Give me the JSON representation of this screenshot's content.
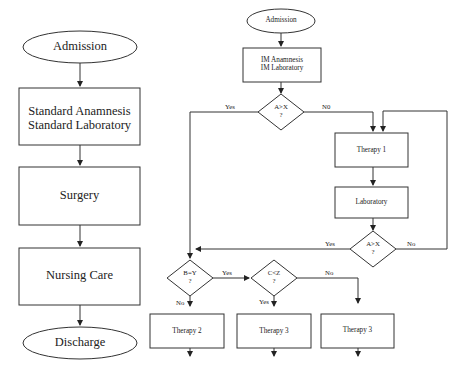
{
  "left_flow": {
    "title": "Standard pathway",
    "nodes": [
      {
        "id": "admission",
        "type": "terminal",
        "label": "Admission"
      },
      {
        "id": "standard-assessment",
        "type": "process",
        "line1": "Standard Anamnesis",
        "line2": "Standard Laboratory"
      },
      {
        "id": "surgery",
        "type": "process",
        "label": "Surgery"
      },
      {
        "id": "nursing-care",
        "type": "process",
        "label": "Nursing Care"
      },
      {
        "id": "discharge",
        "type": "terminal",
        "label": "Discharge"
      }
    ]
  },
  "right_flow": {
    "admission": {
      "label": "Admission"
    },
    "im_assessment": {
      "line1": "IM Anamnesis",
      "line2": "IM Laboratory"
    },
    "decision1": {
      "line1": "A>X",
      "line2": "?",
      "yes": "Yes",
      "no": "N0"
    },
    "therapy1": {
      "label": "Therapy 1"
    },
    "laboratory": {
      "label": "Laboratory"
    },
    "decision2": {
      "line1": "A>X",
      "line2": "?",
      "yes": "Yes",
      "no": "No"
    },
    "decision3": {
      "line1": "B=Y",
      "line2": "?",
      "yes": "Yes",
      "no": "No"
    },
    "decision4": {
      "line1": "C<Z",
      "line2": "?",
      "yes": "Yes",
      "no": "No"
    },
    "therapy2": {
      "label": "Therapy 2"
    },
    "therapy3a": {
      "label": "Therapy 3"
    },
    "therapy3b": {
      "label": "Therapy 3"
    }
  },
  "colors": {
    "stroke": "#333333",
    "background": "#ffffff"
  }
}
